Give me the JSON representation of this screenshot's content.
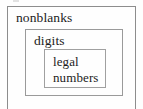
{
  "figure": {
    "type": "nested-set-diagram",
    "background_color": "#fefefe",
    "text_color": "#1c1c1c",
    "border_color": "#8d8d8d",
    "sets": [
      {
        "id": "nonblanks",
        "label": "nonblanks",
        "level": 0
      },
      {
        "id": "digits",
        "label": "digits",
        "level": 1
      },
      {
        "id": "legal-numbers",
        "label_line_1": "legal",
        "label_line_2": "numbers",
        "level": 2
      }
    ]
  }
}
